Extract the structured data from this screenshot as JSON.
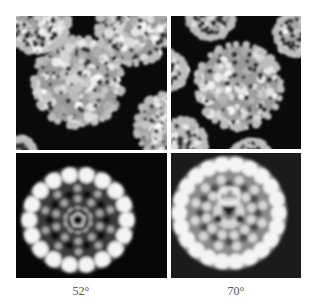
{
  "figure": {
    "panels": [
      {
        "id": "tilt-52-micrograph",
        "kind": "cryo-EM particle image",
        "tilt_label_index": 0
      },
      {
        "id": "tilt-70-micrograph",
        "kind": "cryo-EM particle image",
        "tilt_label_index": 1
      },
      {
        "id": "tilt-52-reconstruction",
        "kind": "3D reconstruction projection (5-fold view)",
        "tilt_label_index": 0
      },
      {
        "id": "tilt-70-reconstruction",
        "kind": "3D reconstruction projection",
        "tilt_label_index": 1
      }
    ],
    "labels": [
      "52°",
      "70°"
    ],
    "colors": {
      "background": "#ffffff",
      "panel_dark": "#0a0a0a",
      "panel_gray": "#1b1b1b",
      "density_bright": "#f2f2f2",
      "label_text": "#555555"
    }
  }
}
